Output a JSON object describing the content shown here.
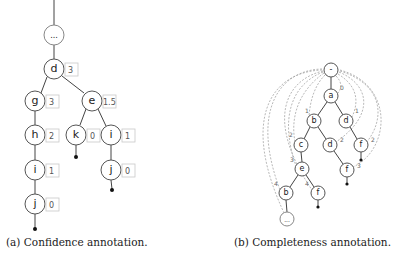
{
  "figure_a": {
    "caption": "(a) Confidence annotation.",
    "nodes": [
      {
        "id": "root",
        "label": "...",
        "confidence": null
      },
      {
        "id": "d",
        "label": "d",
        "confidence": "3"
      },
      {
        "id": "g",
        "label": "g",
        "confidence": "3"
      },
      {
        "id": "e",
        "label": "e",
        "confidence": "1.5"
      },
      {
        "id": "h",
        "label": "h",
        "confidence": "2"
      },
      {
        "id": "k",
        "label": "k",
        "confidence": "0"
      },
      {
        "id": "i_right",
        "label": "i",
        "confidence": "1"
      },
      {
        "id": "i_left",
        "label": "i",
        "confidence": "1"
      },
      {
        "id": "j_right",
        "label": "j",
        "confidence": "0"
      },
      {
        "id": "j_left",
        "label": "j",
        "confidence": "0"
      }
    ]
  },
  "figure_b": {
    "caption": "(b) Completeness annotation.",
    "nodes": [
      {
        "id": "root",
        "label": "-",
        "completeness": null
      },
      {
        "id": "a",
        "label": "a",
        "completeness": "0"
      },
      {
        "id": "b1",
        "label": "b",
        "completeness": "1"
      },
      {
        "id": "d1",
        "label": "d",
        "completeness": "1"
      },
      {
        "id": "c",
        "label": "c",
        "completeness": "2"
      },
      {
        "id": "d2",
        "label": "d",
        "completeness": "2"
      },
      {
        "id": "f1",
        "label": "f",
        "completeness": "2"
      },
      {
        "id": "e",
        "label": "e",
        "completeness": "3"
      },
      {
        "id": "f2",
        "label": "f",
        "completeness": "3"
      },
      {
        "id": "b2",
        "label": "b",
        "completeness": "4"
      },
      {
        "id": "f3",
        "label": "f",
        "completeness": "4"
      },
      {
        "id": "more",
        "label": "...",
        "completeness": null
      }
    ]
  }
}
